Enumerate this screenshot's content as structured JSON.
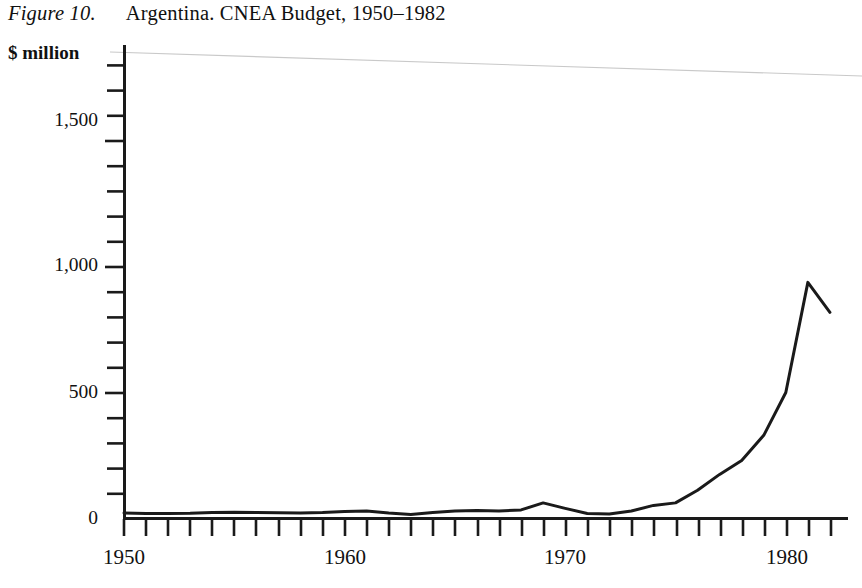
{
  "figure": {
    "label": "Figure 10.",
    "caption": "Argentina. CNEA Budget, 1950–1982"
  },
  "chart_data": {
    "type": "line",
    "title": "Argentina. CNEA Budget, 1950–1982",
    "xlabel": "",
    "ylabel": "$ million",
    "ylabel_position": "top-left",
    "xlim": [
      1950,
      1982
    ],
    "ylim": [
      0,
      1780
    ],
    "grid": false,
    "legend": null,
    "y_major_ticks": [
      0,
      500,
      1000,
      1500
    ],
    "y_major_tick_labels": [
      "0",
      "500",
      "1,000",
      "1,500"
    ],
    "y_minor_tick_interval": 100,
    "x_major_ticks": [
      1950,
      1960,
      1970,
      1980
    ],
    "x_major_tick_labels": [
      "1950",
      "1960",
      "1970",
      "1980"
    ],
    "x_minor_tick_interval": 1,
    "line_color": "#1a1a1a",
    "line_width": 3,
    "x": [
      1950,
      1951,
      1952,
      1953,
      1954,
      1955,
      1956,
      1957,
      1958,
      1959,
      1960,
      1961,
      1962,
      1963,
      1964,
      1965,
      1966,
      1967,
      1968,
      1969,
      1970,
      1971,
      1972,
      1973,
      1974,
      1975,
      1976,
      1977,
      1978,
      1979,
      1980,
      1981
    ],
    "values": [
      22,
      20,
      20,
      21,
      24,
      25,
      24,
      23,
      22,
      24,
      28,
      30,
      22,
      16,
      24,
      30,
      32,
      30,
      34,
      62,
      40,
      20,
      18,
      30,
      52,
      62,
      112,
      175,
      230,
      330,
      500,
      937
    ],
    "series": [
      {
        "name": "CNEA Budget",
        "units": "$ million",
        "values": [
          22,
          20,
          20,
          21,
          24,
          25,
          24,
          23,
          22,
          24,
          28,
          30,
          22,
          16,
          24,
          30,
          32,
          30,
          34,
          62,
          40,
          20,
          18,
          30,
          52,
          62,
          112,
          175,
          230,
          330,
          500,
          937
        ]
      }
    ],
    "tail_segment": {
      "from_x": 1981,
      "from_y": 937,
      "to_x": 1982,
      "to_y": 818,
      "note": "peak then decline to final year"
    },
    "peak": {
      "x": 1981,
      "y": 937
    }
  },
  "axis": {
    "units_label": "$ million",
    "y_labels": [
      "1,500",
      "1,000",
      "500",
      "0"
    ],
    "x_labels": [
      "1950",
      "1960",
      "1970",
      "1980"
    ]
  }
}
